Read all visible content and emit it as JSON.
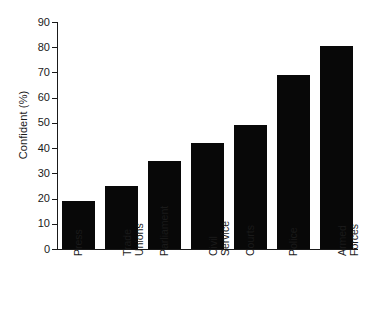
{
  "chart_data": {
    "type": "bar",
    "title": "",
    "subtitle": "",
    "xlabel": "",
    "ylabel": "Confident (%)",
    "categories": [
      "Press",
      "Trade\nUnions",
      "Parliament",
      "Civil\nService",
      "Courts",
      "Police",
      "Armed\nForces"
    ],
    "values": [
      19,
      25,
      35,
      42,
      49,
      69,
      80.5
    ],
    "ylim": [
      0,
      90
    ],
    "yticks": [
      0,
      10,
      20,
      30,
      40,
      50,
      60,
      70,
      80,
      90
    ],
    "ytick_labels": [
      "0",
      "10",
      "20",
      "30",
      "40",
      "50",
      "60",
      "70",
      "80",
      "90"
    ],
    "grid": false,
    "legend": null,
    "bar_color": "#080808",
    "axis_color": "#1a1a1a",
    "background_color": "#ffffff"
  }
}
